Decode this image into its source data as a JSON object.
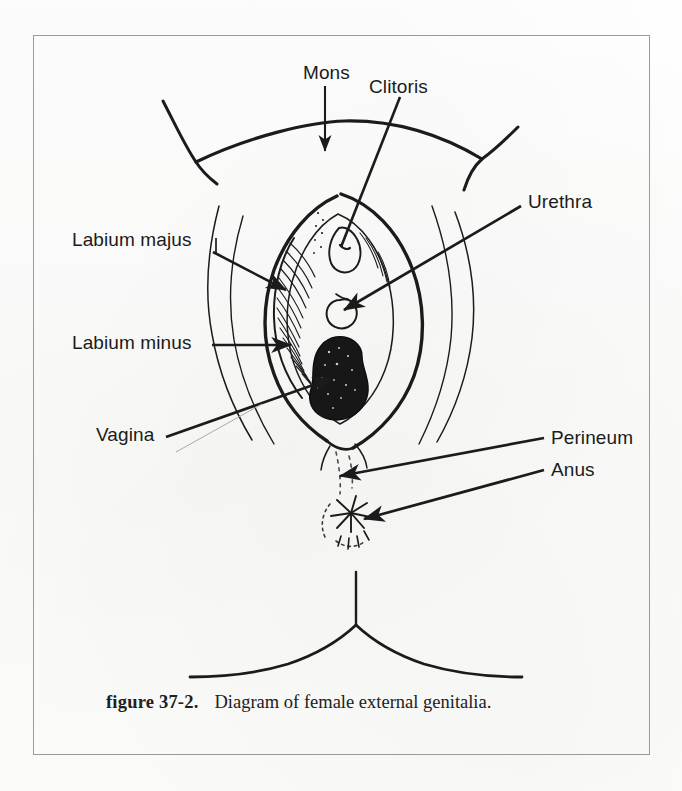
{
  "figure": {
    "caption_number": "figure 37-2.",
    "caption_text": "Diagram of female external genitalia.",
    "border_color": "#9a9a9a",
    "ink_color": "#1b1b1b",
    "paper_color": "#fdfdfc"
  },
  "labels": [
    {
      "id": "mons",
      "text": "Mons",
      "x": 303,
      "y": 72,
      "pointer": "down-arrow"
    },
    {
      "id": "clitoris",
      "text": "Clitoris",
      "x": 369,
      "y": 85,
      "pointer": "diagonal-line-down-left"
    },
    {
      "id": "urethra",
      "text": "Urethra",
      "x": 528,
      "y": 200,
      "pointer": "diagonal-arrow-down-left"
    },
    {
      "id": "labium-majus",
      "text": "Labium majus",
      "x": 72,
      "y": 238,
      "pointer": "diagonal-arrow-right-down"
    },
    {
      "id": "labium-minus",
      "text": "Labium minus",
      "x": 72,
      "y": 341,
      "pointer": "horizontal-arrow-right"
    },
    {
      "id": "vagina",
      "text": "Vagina",
      "x": 96,
      "y": 428,
      "pointer": "diagonal-arrow-up-right"
    },
    {
      "id": "perineum",
      "text": "Perineum",
      "x": 551,
      "y": 436,
      "pointer": "arrow-left"
    },
    {
      "id": "anus",
      "text": "Anus",
      "x": 551,
      "y": 468,
      "pointer": "arrow-left"
    }
  ],
  "anatomy_parts": [
    {
      "id": "mons-pubis-curve",
      "name": "mons pubis contour"
    },
    {
      "id": "left-groin-crease",
      "name": "left inguinal crease"
    },
    {
      "id": "right-groin-crease",
      "name": "right inguinal crease"
    },
    {
      "id": "left-thigh",
      "name": "left thigh contour"
    },
    {
      "id": "right-thigh",
      "name": "right thigh contour"
    },
    {
      "id": "labia-majora",
      "name": "labia majora outline"
    },
    {
      "id": "labia-minora",
      "name": "labia minora hatched"
    },
    {
      "id": "clitoral-hood",
      "name": "clitoral hood"
    },
    {
      "id": "urethral-opening",
      "name": "urethral meatus"
    },
    {
      "id": "vaginal-opening",
      "name": "vaginal introitus"
    },
    {
      "id": "perineum-body",
      "name": "perineal body"
    },
    {
      "id": "anus-star",
      "name": "anal opening"
    },
    {
      "id": "gluteal-cleft",
      "name": "gluteal cleft"
    }
  ]
}
